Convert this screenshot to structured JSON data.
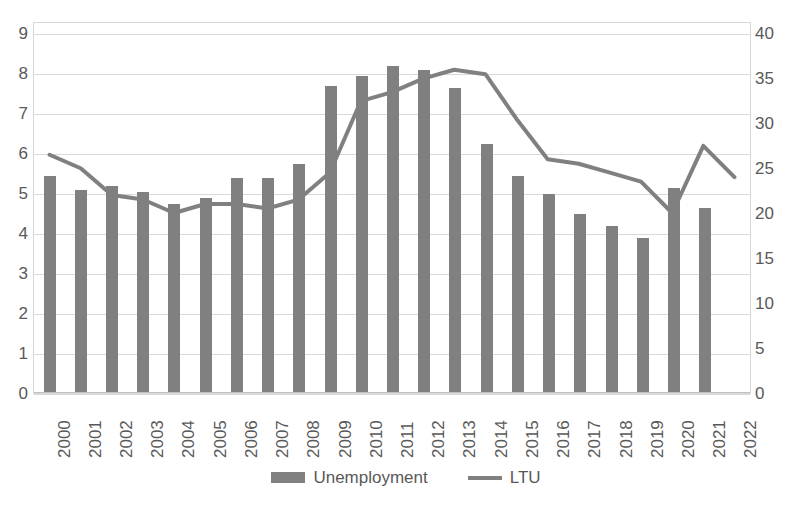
{
  "chart_data": {
    "type": "bar",
    "title": "",
    "subtitle": "",
    "xlabel": "",
    "ylabel": "",
    "categories": [
      "2000",
      "2001",
      "2002",
      "2003",
      "2004",
      "2005",
      "2006",
      "2007",
      "2008",
      "2009",
      "2010",
      "2011",
      "2012",
      "2013",
      "2014",
      "2015",
      "2016",
      "2017",
      "2018",
      "2019",
      "2020",
      "2021",
      "2022"
    ],
    "grid": true,
    "legend_position": "bottom",
    "axes": {
      "left": {
        "label": "",
        "min": 0,
        "max": 9,
        "step": 1,
        "ticks": [
          "0",
          "1",
          "2",
          "3",
          "4",
          "5",
          "6",
          "7",
          "8",
          "9"
        ]
      },
      "right": {
        "label": "",
        "min": 0,
        "max": 40,
        "step": 5,
        "ticks": [
          "0",
          "5",
          "10",
          "15",
          "20",
          "25",
          "30",
          "35",
          "40"
        ]
      }
    },
    "series": [
      {
        "name": "Unemployment",
        "type": "bar",
        "axis": "left",
        "color": "#808080",
        "values": [
          5.4,
          5.05,
          5.15,
          5.0,
          4.7,
          4.85,
          5.35,
          5.35,
          5.7,
          7.65,
          7.9,
          8.15,
          8.05,
          7.6,
          6.2,
          5.4,
          4.95,
          4.45,
          4.15,
          3.85,
          5.1,
          4.6,
          null
        ]
      },
      {
        "name": "LTU",
        "type": "line",
        "axis": "right",
        "color": "#808080",
        "values": [
          26.5,
          25.0,
          22.0,
          21.5,
          20.0,
          21.0,
          21.0,
          20.5,
          21.5,
          24.5,
          32.5,
          33.5,
          35.0,
          36.0,
          35.5,
          30.5,
          26.0,
          25.5,
          24.5,
          23.5,
          20.0,
          27.5,
          24.0
        ]
      }
    ]
  },
  "legend": {
    "items": [
      {
        "label": "Unemployment",
        "marker": "bar-swatch",
        "color": "#808080"
      },
      {
        "label": "LTU",
        "marker": "line-swatch",
        "color": "#808080"
      }
    ]
  }
}
